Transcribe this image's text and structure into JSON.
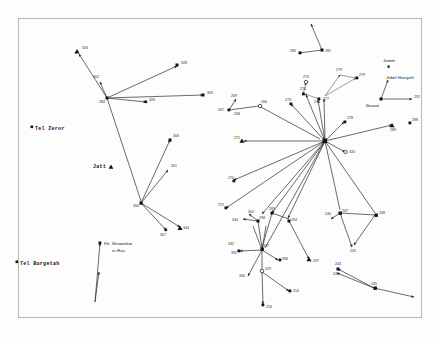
{
  "figure": {
    "kind": "archaeological-site-network-map",
    "frame": {
      "x": 18,
      "y": 18,
      "w": 404,
      "h": 300,
      "stroke": "#b9b9b9"
    },
    "colors": {
      "line": "#2b2b2b",
      "marker": "#111111",
      "label": "#2a2a2a",
      "background": "#fdfdfd"
    }
  },
  "named_places": [
    {
      "id": "tel-zeror",
      "label": "Tel Zeror",
      "x": 33,
      "y": 128,
      "marker": "square"
    },
    {
      "id": "jatt",
      "label": "Jatt",
      "x": 93,
      "y": 167,
      "marker": "triangle-right"
    },
    {
      "id": "tel-burgetah",
      "label": "Tel Burgetah",
      "x": 18,
      "y": 263,
      "marker": "square"
    },
    {
      "id": "kh-shuweikat",
      "label": "Kh. Shuweikat",
      "x": 104,
      "y": 244,
      "marker": "square"
    },
    {
      "id": "er-ras",
      "label": "er-Ras",
      "x": 112,
      "y": 251,
      "marker": "none"
    },
    {
      "id": "jamm",
      "label": "Jamm",
      "x": 390,
      "y": 60,
      "marker": "square-small"
    },
    {
      "id": "jebel-haniyeh",
      "label": "Jebel Haniyeh",
      "x": 386,
      "y": 78,
      "marker": "none"
    },
    {
      "id": "ibsaan",
      "label": "Ibsaan",
      "x": 368,
      "y": 101,
      "marker": "none"
    }
  ],
  "sites": [
    {
      "id": "326",
      "label": "326",
      "x": 77,
      "y": 52,
      "marker": "triangle"
    },
    {
      "id": "328",
      "label": "328",
      "x": 179,
      "y": 65,
      "marker": "triangle"
    },
    {
      "id": "302",
      "label": "302",
      "x": 96,
      "y": 78,
      "marker": "none"
    },
    {
      "id": "284",
      "label": "284",
      "x": 107,
      "y": 98,
      "marker": "hub"
    },
    {
      "id": "309",
      "label": "309",
      "x": 150,
      "y": 100,
      "marker": "square"
    },
    {
      "id": "303",
      "label": "303",
      "x": 206,
      "y": 95,
      "marker": "triangle"
    },
    {
      "id": "306",
      "label": "306",
      "x": 172,
      "y": 138,
      "marker": "square"
    },
    {
      "id": "301",
      "label": "301",
      "x": 170,
      "y": 168,
      "marker": "none"
    },
    {
      "id": "300",
      "label": "300",
      "x": 141,
      "y": 203,
      "marker": "hub"
    },
    {
      "id": "307",
      "label": "307",
      "x": 163,
      "y": 229,
      "marker": "none"
    },
    {
      "id": "344",
      "label": "344",
      "x": 182,
      "y": 228,
      "marker": "triangle"
    },
    {
      "id": "280",
      "label": "280",
      "x": 293,
      "y": 52,
      "marker": "square"
    },
    {
      "id": "281",
      "label": "281",
      "x": 325,
      "y": 48,
      "marker": "square"
    },
    {
      "id": "269",
      "label": "269",
      "x": 233,
      "y": 94,
      "marker": "none"
    },
    {
      "id": "267",
      "label": "267",
      "x": 222,
      "y": 113,
      "marker": "none"
    },
    {
      "id": "268",
      "label": "268",
      "x": 238,
      "y": 112,
      "marker": "none"
    },
    {
      "id": "266",
      "label": "266",
      "x": 263,
      "y": 108,
      "marker": "circle-open"
    },
    {
      "id": "273",
      "label": "273",
      "x": 288,
      "y": 102,
      "marker": "square"
    },
    {
      "id": "274",
      "label": "274",
      "x": 303,
      "y": 92,
      "marker": "square"
    },
    {
      "id": "275",
      "label": "275",
      "x": 305,
      "y": 80,
      "marker": "circle-open"
    },
    {
      "id": "276",
      "label": "276",
      "x": 317,
      "y": 98,
      "marker": "square"
    },
    {
      "id": "277",
      "label": "277",
      "x": 325,
      "y": 96,
      "marker": "none"
    },
    {
      "id": "279",
      "label": "279",
      "x": 338,
      "y": 72,
      "marker": "none"
    },
    {
      "id": "278a",
      "label": "279",
      "x": 360,
      "y": 77,
      "marker": "square"
    },
    {
      "id": "271",
      "label": "271",
      "x": 240,
      "y": 140,
      "marker": "triangle"
    },
    {
      "id": "278",
      "label": "278",
      "x": 348,
      "y": 120,
      "marker": "square"
    },
    {
      "id": "320",
      "label": "320",
      "x": 348,
      "y": 151,
      "marker": "circle-open"
    },
    {
      "id": "288",
      "label": "288",
      "x": 411,
      "y": 122,
      "marker": "square"
    },
    {
      "id": "289",
      "label": "289",
      "x": 396,
      "y": 128,
      "marker": "triangle"
    },
    {
      "id": "292",
      "label": "292",
      "x": 417,
      "y": 98,
      "marker": "none"
    },
    {
      "id": "270",
      "label": "270",
      "x": 230,
      "y": 178,
      "marker": "none"
    },
    {
      "id": "272",
      "label": "272",
      "x": 222,
      "y": 207,
      "marker": "square"
    },
    {
      "id": "hub-right",
      "label": "",
      "x": 325,
      "y": 141,
      "marker": "hub"
    },
    {
      "id": "302b",
      "label": "302",
      "x": 246,
      "y": 213,
      "marker": "none"
    },
    {
      "id": "298",
      "label": "298",
      "x": 258,
      "y": 221,
      "marker": "square"
    },
    {
      "id": "334",
      "label": "334",
      "x": 238,
      "y": 221,
      "marker": "none"
    },
    {
      "id": "283",
      "label": "283",
      "x": 269,
      "y": 212,
      "marker": "square"
    },
    {
      "id": "294",
      "label": "294",
      "x": 289,
      "y": 221,
      "marker": "square"
    },
    {
      "id": "297",
      "label": "297",
      "x": 311,
      "y": 262,
      "marker": "triangle"
    },
    {
      "id": "332",
      "label": "332",
      "x": 232,
      "y": 245,
      "marker": "none"
    },
    {
      "id": "331",
      "label": "331",
      "x": 236,
      "y": 252,
      "marker": "square"
    },
    {
      "id": "337",
      "label": "337",
      "x": 262,
      "y": 250,
      "marker": "hub"
    },
    {
      "id": "336",
      "label": "336",
      "x": 281,
      "y": 259,
      "marker": "square"
    },
    {
      "id": "330",
      "label": "330",
      "x": 243,
      "y": 278,
      "marker": "none"
    },
    {
      "id": "329",
      "label": "329",
      "x": 262,
      "y": 272,
      "marker": "circle-open"
    },
    {
      "id": "214",
      "label": "214",
      "x": 292,
      "y": 291,
      "marker": "square"
    },
    {
      "id": "216",
      "label": "216",
      "x": 265,
      "y": 307,
      "marker": "square"
    },
    {
      "id": "246",
      "label": "246",
      "x": 327,
      "y": 215,
      "marker": "none"
    },
    {
      "id": "247",
      "label": "247",
      "x": 340,
      "y": 213,
      "marker": "square"
    },
    {
      "id": "248",
      "label": "248",
      "x": 378,
      "y": 216,
      "marker": "square"
    },
    {
      "id": "245",
      "label": "245",
      "x": 350,
      "y": 250,
      "marker": "none"
    },
    {
      "id": "244",
      "label": "244",
      "x": 336,
      "y": 265,
      "marker": "square"
    },
    {
      "id": "243",
      "label": "243",
      "x": 333,
      "y": 273,
      "marker": "none"
    },
    {
      "id": "245b",
      "label": "245",
      "x": 377,
      "y": 288,
      "marker": "square"
    }
  ],
  "clusters": [
    {
      "id": "cluster-jatt-284",
      "hub": "284",
      "hub_x": 107,
      "hub_y": 98
    },
    {
      "id": "cluster-jatt-300",
      "hub": "300",
      "hub_x": 141,
      "hub_y": 203
    },
    {
      "id": "cluster-main-hub",
      "hub": "hub-right",
      "hub_x": 325,
      "hub_y": 141
    },
    {
      "id": "cluster-337",
      "hub": "337",
      "hub_x": 262,
      "hub_y": 250
    }
  ],
  "caption": {
    "present": false,
    "text": ""
  }
}
